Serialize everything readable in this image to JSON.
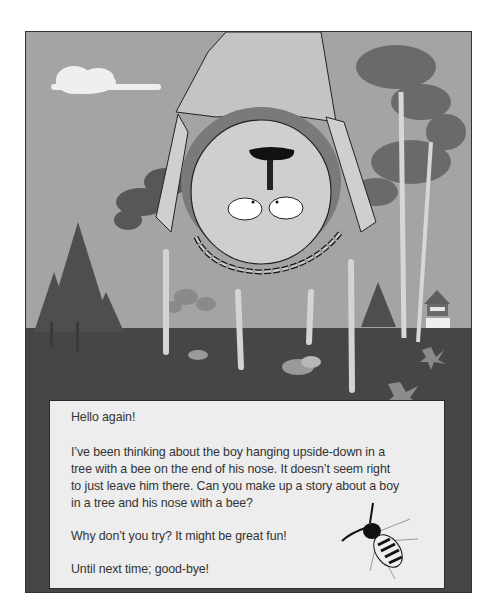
{
  "illustration": {
    "description": "Cartoon of a boy hanging upside-down from a tree with a bee on the end of his nose, in a wooded landscape with pine trees, a small house, fallen leaves and a cloud",
    "colors": {
      "sky": "#a4a4a4",
      "ground": "#464646",
      "letter_bg": "#ededed",
      "text": "#333333"
    }
  },
  "letter": {
    "greeting": "Hello again!",
    "paragraph1_line1": "I’ve been thinking about the boy hanging upside-down in a",
    "paragraph1_line2": "tree with a bee on the end of his nose.  It doesn’t seem right",
    "paragraph1_line3": "to just leave him there.  Can you make up a story about a boy",
    "paragraph1_line4": "in a tree and his nose with a bee?",
    "paragraph2": "Why don’t you try?  It might be great fun!",
    "closing": "Until next time; good-bye!"
  }
}
